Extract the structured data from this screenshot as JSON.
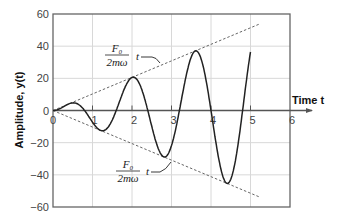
{
  "chart_data": {
    "type": "line",
    "title": "",
    "xlabel": "Time t",
    "ylabel": "Amplitude, y(t)",
    "xlim": [
      0,
      6
    ],
    "ylim": [
      -60,
      60
    ],
    "xticks": [
      "0",
      "1",
      "2",
      "3",
      "4",
      "5",
      "6"
    ],
    "yticks": [
      "60",
      "40",
      "20",
      "0",
      "-20",
      "-40",
      "-60"
    ],
    "grid": true,
    "series": [
      {
        "name": "y(t) resonant response",
        "style": "solid",
        "x": [
          0,
          0.4,
          1.2,
          2.0,
          2.8,
          3.6,
          4.4,
          5.0
        ],
        "y": [
          0,
          5,
          -13,
          21,
          -29,
          37,
          -44,
          48
        ]
      },
      {
        "name": "upper envelope (F0/2mω) t",
        "style": "dashed",
        "x": [
          0,
          5.25
        ],
        "y": [
          0,
          54
        ]
      },
      {
        "name": "lower envelope -(F0/2mω) t",
        "style": "dashed",
        "x": [
          0,
          5.25
        ],
        "y": [
          0,
          -54
        ]
      }
    ],
    "annotations": [
      {
        "text_num": "F0",
        "text_den": "2mω",
        "text_suffix": "t",
        "target": "upper envelope"
      },
      {
        "text_num": "F0",
        "text_den": "2mω",
        "text_suffix": "t",
        "target": "lower envelope"
      }
    ],
    "colors": {
      "curve": "#222222",
      "envelope": "#666666",
      "grid": "#d8d8d8",
      "axis": "#555555"
    }
  }
}
